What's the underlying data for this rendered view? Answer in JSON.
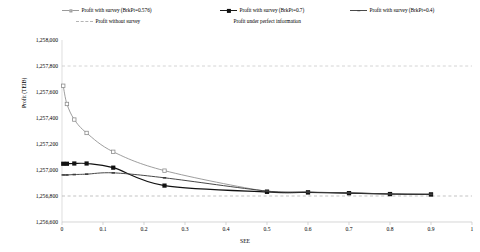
{
  "chart_data": {
    "type": "line",
    "title": "",
    "xlabel": "SEE",
    "ylabel": "Profit (TEIB)",
    "xlim": [
      0,
      1
    ],
    "ylim": [
      1256600,
      1258000
    ],
    "grid": "horizontal-dashed-reference-lines",
    "legend_position": "top",
    "xticks": [
      "0",
      "0.1",
      "0.2",
      "0.3",
      "0.4",
      "0.5",
      "0.6",
      "0.7",
      "0.8",
      "0.9",
      "1"
    ],
    "xtick_values": [
      0,
      0.1,
      0.2,
      0.3,
      0.4,
      0.5,
      0.6,
      0.7,
      0.8,
      0.9,
      1
    ],
    "yticks": [
      "1,256,600",
      "1,256,800",
      "1,257,000",
      "1,257,200",
      "1,257,400",
      "1,257,600",
      "1,257,800",
      "1,258,000"
    ],
    "ytick_values": [
      1256600,
      1256800,
      1257000,
      1257200,
      1257400,
      1257600,
      1257800,
      1258000
    ],
    "series": [
      {
        "name": "Profit with survey (BrkPt=0.576)",
        "style": "line-marker-open-square",
        "color": "#8d8d8d",
        "x": [
          0.003,
          0.012,
          0.03,
          0.06,
          0.125,
          0.25,
          0.5,
          0.6,
          0.7,
          0.8,
          0.9
        ],
        "values": [
          1257648,
          1257508,
          1257388,
          1257285,
          1257140,
          1256995,
          1256835,
          1256828,
          1256822,
          1256815,
          1256812
        ]
      },
      {
        "name": "Profit with survey (BrkPt=0.7)",
        "style": "line-marker-filled-square",
        "color": "#111111",
        "x": [
          0.003,
          0.012,
          0.03,
          0.06,
          0.125,
          0.25,
          0.5,
          0.6,
          0.7,
          0.8,
          0.9
        ],
        "values": [
          1257048,
          1257048,
          1257050,
          1257050,
          1257018,
          1256880,
          1256832,
          1256828,
          1256822,
          1256815,
          1256812
        ]
      },
      {
        "name": "Profit with survey (BrkPt=0.4)",
        "style": "line-marker-dash",
        "color": "#3d3d3d",
        "x": [
          0.003,
          0.012,
          0.03,
          0.06,
          0.125,
          0.25,
          0.5,
          0.6,
          0.7,
          0.8,
          0.9
        ],
        "values": [
          1256962,
          1256962,
          1256965,
          1256968,
          1256978,
          1256940,
          1256838,
          1256830,
          1256824,
          1256816,
          1256813
        ]
      },
      {
        "name": "Profit without survey",
        "style": "dashed-horizontal-reference",
        "color": "#b4b4b4",
        "constant": 1256800
      },
      {
        "name": "Profit under perfect information",
        "style": "dashed-horizontal-reference",
        "color": "#c9c9c9",
        "constant": 1257800
      }
    ]
  },
  "legend": {
    "items": [
      {
        "label": "Profit with survey (BrkPt=0.576)"
      },
      {
        "label": "Profit with survey (BrkPt=0.7)"
      },
      {
        "label": "Profit with survey (BrkPt=0.4)"
      },
      {
        "label": "Profit without survey"
      },
      {
        "label": "Profit under perfect information"
      }
    ]
  },
  "axes": {
    "y_title": "Profit (TEIB)",
    "x_title": "SEE"
  }
}
